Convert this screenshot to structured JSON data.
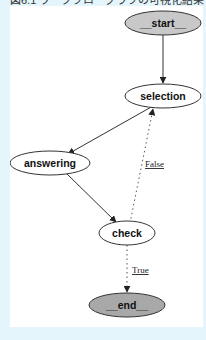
{
  "caption": "図6.1 ワークフローグラフの可視化結果",
  "colors": {
    "frame_bg": "#e4f6fb",
    "canvas_bg": "#ffffff",
    "terminal_fill": "#c8c8c8",
    "node_fill": "#ffffff",
    "stroke": "#333333"
  },
  "graph": {
    "nodes": [
      {
        "id": "start",
        "label": "__start__",
        "type": "terminal"
      },
      {
        "id": "selection",
        "label": "selection",
        "type": "process"
      },
      {
        "id": "answering",
        "label": "answering",
        "type": "process"
      },
      {
        "id": "check",
        "label": "check",
        "type": "process"
      },
      {
        "id": "end",
        "label": "__end__",
        "type": "terminal"
      }
    ],
    "edges": [
      {
        "from": "start",
        "to": "selection",
        "style": "solid",
        "label": ""
      },
      {
        "from": "selection",
        "to": "answering",
        "style": "solid",
        "label": ""
      },
      {
        "from": "answering",
        "to": "check",
        "style": "solid",
        "label": ""
      },
      {
        "from": "check",
        "to": "selection",
        "style": "dotted",
        "label": "False"
      },
      {
        "from": "check",
        "to": "end",
        "style": "dotted",
        "label": "True"
      }
    ]
  }
}
